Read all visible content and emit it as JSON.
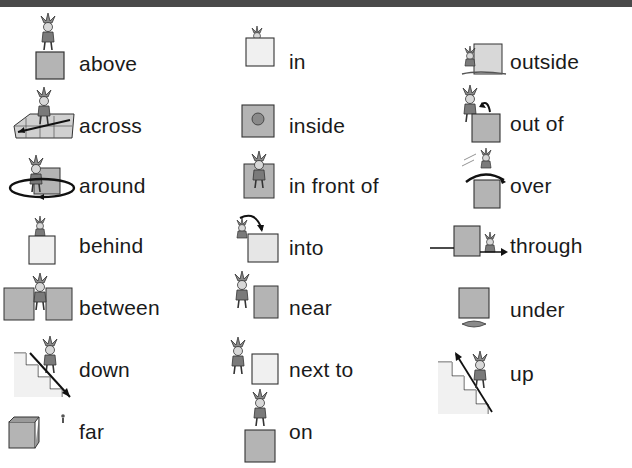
{
  "header": {
    "bar_color": "#4a4a4a"
  },
  "colors": {
    "box_grey": "#b4b4b4",
    "box_light": "#ededed",
    "outline": "#333333",
    "text": "#1a1a1a"
  },
  "columns": [
    {
      "items": [
        {
          "word": "above",
          "icon": "jester-above-box-icon"
        },
        {
          "word": "across",
          "icon": "jester-across-grid-icon"
        },
        {
          "word": "around",
          "icon": "jester-around-box-icon"
        },
        {
          "word": "behind",
          "icon": "jester-behind-box-icon"
        },
        {
          "word": "between",
          "icon": "jester-between-boxes-icon"
        },
        {
          "word": "down",
          "icon": "jester-down-stairs-icon"
        },
        {
          "word": "far",
          "icon": "jester-far-from-box-icon"
        }
      ]
    },
    {
      "items": [
        {
          "word": "in",
          "icon": "jester-in-box-icon"
        },
        {
          "word": "inside",
          "icon": "jester-inside-box-icon"
        },
        {
          "word": "in front of",
          "icon": "jester-in-front-of-box-icon"
        },
        {
          "word": "into",
          "icon": "jester-into-box-icon"
        },
        {
          "word": "near",
          "icon": "jester-near-box-icon"
        },
        {
          "word": "next to",
          "icon": "jester-next-to-box-icon"
        },
        {
          "word": "on",
          "icon": "jester-on-box-icon"
        }
      ]
    },
    {
      "items": [
        {
          "word": "outside",
          "icon": "jester-outside-box-icon"
        },
        {
          "word": "out of",
          "icon": "jester-out-of-box-icon"
        },
        {
          "word": "over",
          "icon": "jester-over-box-icon"
        },
        {
          "word": "through",
          "icon": "jester-through-box-icon"
        },
        {
          "word": "under",
          "icon": "jester-under-box-icon"
        },
        {
          "word": "up",
          "icon": "jester-up-stairs-icon"
        }
      ]
    }
  ]
}
